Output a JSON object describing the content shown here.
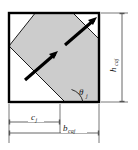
{
  "figure": {
    "type": "engineering-cross-section-diagram",
    "shape": {
      "outline_name": "square-outline",
      "band_name": "inclined-shaded-band",
      "band_fill_color": "#cccccc",
      "outline_color": "#000000",
      "background_color": "#ffffff",
      "arrow_color": "#000000",
      "arrow_count": 2,
      "arrow_direction": "up-right"
    },
    "labels": {
      "height": {
        "symbol": "h",
        "subscript": "caj",
        "orientation": "vertical",
        "position": "right"
      },
      "width_full": {
        "symbol": "b",
        "subscript": "caj",
        "orientation": "horizontal",
        "position": "bottom"
      },
      "offset": {
        "symbol": "c",
        "subscript": "j",
        "orientation": "horizontal",
        "position": "bottom-upper-dimension-line"
      },
      "angle": {
        "symbol": "θ",
        "subscript": "j",
        "orientation": "horizontal",
        "position": "inside-lower-right"
      }
    }
  }
}
